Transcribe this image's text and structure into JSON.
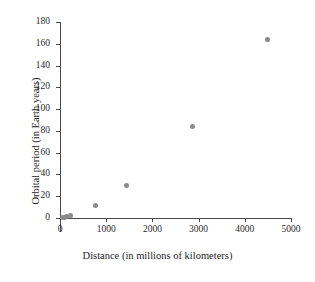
{
  "chart_data": {
    "type": "scatter",
    "title": "",
    "xlabel": "Distance (in millions of kilometers)",
    "ylabel": "Orbital period (in Earth years)",
    "xlim": [
      0,
      5000
    ],
    "ylim": [
      0,
      180
    ],
    "xticks": [
      0,
      1000,
      2000,
      3000,
      4000,
      5000
    ],
    "yticks": [
      0,
      20,
      40,
      60,
      80,
      100,
      120,
      140,
      160,
      180
    ],
    "xtick_labels": [
      "0",
      "1000",
      "2000",
      "3000",
      "4000",
      "5000"
    ],
    "ytick_labels": [
      "0",
      "20",
      "40",
      "60",
      "80",
      "100",
      "120",
      "140",
      "160",
      "180"
    ],
    "grid": false,
    "legend": false,
    "marker_color": "#8a8a8a",
    "axis_color": "#4a4a4a",
    "points": [
      {
        "x": 58,
        "y": 0.24
      },
      {
        "x": 108,
        "y": 0.62
      },
      {
        "x": 150,
        "y": 1.0
      },
      {
        "x": 228,
        "y": 1.88
      },
      {
        "x": 778,
        "y": 11.9
      },
      {
        "x": 1430,
        "y": 29.5
      },
      {
        "x": 2870,
        "y": 84.0
      },
      {
        "x": 4500,
        "y": 164.0
      }
    ]
  }
}
